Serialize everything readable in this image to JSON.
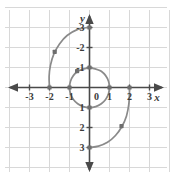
{
  "chart_data": {
    "type": "line",
    "title": "",
    "subtitle": "",
    "xlabel": "x",
    "ylabel": "y",
    "xlim": [
      -3.7,
      3.7
    ],
    "ylim": [
      -3.6,
      3.5
    ],
    "grid": true,
    "legend": null,
    "x_ticks": [
      -3,
      -2,
      -1,
      0,
      1,
      2,
      3
    ],
    "y_ticks": [
      -3,
      -2,
      -1,
      0,
      1,
      2,
      3
    ],
    "x_tick_labels": [
      "-3",
      "-2",
      "-1",
      "0",
      "1",
      "2",
      "3"
    ],
    "y_tick_labels": [
      "-3",
      "-2",
      "-1",
      "1",
      "2",
      "3"
    ],
    "grid_color": "#d8d8d8",
    "axis_color": "#4a4a4a",
    "curve_color": "#8a8a8a",
    "marker_color": "#6e6e6e",
    "series": [
      {
        "name": "inner-loop",
        "description": "unit circle loop of spiral, radius 1",
        "points": [
          [
            0.0,
            1.0
          ],
          [
            0.59,
            0.81
          ],
          [
            0.95,
            0.31
          ],
          [
            0.95,
            -0.31
          ],
          [
            0.59,
            -0.81
          ],
          [
            0.0,
            -1.0
          ],
          [
            -0.59,
            -0.81
          ],
          [
            -0.95,
            -0.31
          ],
          [
            -0.95,
            0.31
          ],
          [
            -0.59,
            0.81
          ],
          [
            0.0,
            1.0
          ]
        ]
      },
      {
        "name": "outer-arc-upper-left",
        "description": "spiral arc from (-2,0) rising to (0,3)",
        "points": [
          [
            -2.0,
            0.0
          ],
          [
            -2.02,
            0.55
          ],
          [
            -1.95,
            1.12
          ],
          [
            -1.78,
            1.68
          ],
          [
            -1.5,
            2.18
          ],
          [
            -1.12,
            2.6
          ],
          [
            -0.64,
            2.88
          ],
          [
            -0.1,
            3.0
          ],
          [
            0.0,
            3.0
          ]
        ]
      },
      {
        "name": "outer-arc-lower-right",
        "description": "spiral arc from (0,-3) rising to (2,0)",
        "points": [
          [
            0.0,
            -3.0
          ],
          [
            0.45,
            -2.93
          ],
          [
            0.9,
            -2.74
          ],
          [
            1.3,
            -2.4
          ],
          [
            1.62,
            -1.95
          ],
          [
            1.85,
            -1.42
          ],
          [
            1.97,
            -0.8
          ],
          [
            2.0,
            -0.2
          ],
          [
            2.0,
            0.0
          ]
        ]
      }
    ],
    "marked_points": [
      {
        "x": -2.0,
        "y": 0.0,
        "label": ""
      },
      {
        "x": -1.74,
        "y": 1.78,
        "label": ""
      },
      {
        "x": -0.62,
        "y": 0.82,
        "label": ""
      },
      {
        "x": 0.0,
        "y": 3.0,
        "label": ""
      },
      {
        "x": -1.0,
        "y": 0.0,
        "label": ""
      },
      {
        "x": 0.0,
        "y": 1.0,
        "label": ""
      },
      {
        "x": 1.0,
        "y": 0.0,
        "label": ""
      },
      {
        "x": 0.0,
        "y": -1.0,
        "label": ""
      },
      {
        "x": 2.0,
        "y": 0.0,
        "label": ""
      },
      {
        "x": 1.6,
        "y": -1.93,
        "label": ""
      },
      {
        "x": 0.0,
        "y": -3.0,
        "label": ""
      }
    ],
    "axis_arrows": [
      "left",
      "right",
      "up",
      "down"
    ]
  }
}
